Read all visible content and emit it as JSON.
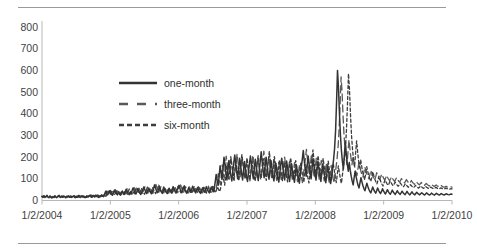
{
  "chart_data": {
    "type": "line",
    "title": "",
    "xlabel": "",
    "ylabel": "",
    "ylim": [
      0,
      800
    ],
    "yticks": [
      0,
      100,
      200,
      300,
      400,
      500,
      600,
      700,
      800
    ],
    "xticks": [
      "1/2/2004",
      "1/2/2005",
      "1/2/2006",
      "1/2/2007",
      "1/2/2008",
      "1/2/2009",
      "1/2/2010"
    ],
    "xlim": [
      "1/2/2004",
      "1/2/2010"
    ],
    "grid": false,
    "legend_position": "upper-center",
    "legend": [
      "one-month",
      "three-month",
      "six-month"
    ],
    "colors": {
      "one-month": "#333333",
      "three-month": "#5a5a5a",
      "six-month": "#3d3d3d",
      "axis": "#b7b7b7",
      "text": "#3f3f3f",
      "border": "#9a9a9a"
    },
    "series": [
      {
        "name": "one-month",
        "style": "solid",
        "values": [
          18,
          15,
          20,
          14,
          17,
          22,
          16,
          13,
          19,
          15,
          12,
          17,
          14,
          20,
          16,
          13,
          18,
          22,
          17,
          14,
          19,
          15,
          21,
          17,
          13,
          18,
          16,
          20,
          15,
          19,
          14,
          17,
          21,
          16,
          13,
          18,
          15,
          22,
          17,
          14,
          20,
          16,
          19,
          15,
          13,
          18,
          21,
          16,
          19,
          24,
          17,
          15,
          22,
          19,
          16,
          25,
          20,
          17,
          14,
          21,
          18,
          26,
          22,
          18,
          30,
          42,
          35,
          26,
          33,
          45,
          38,
          29,
          24,
          36,
          48,
          40,
          31,
          26,
          38,
          30,
          25,
          34,
          44,
          36,
          28,
          40,
          52,
          43,
          33,
          27,
          38,
          30,
          45,
          58,
          47,
          36,
          30,
          42,
          55,
          44,
          34,
          28,
          40,
          50,
          62,
          51,
          40,
          32,
          46,
          58,
          48,
          38,
          31,
          44,
          56,
          72,
          58,
          45,
          36,
          50,
          62,
          50,
          40,
          33,
          46,
          58,
          48,
          38,
          32,
          44,
          56,
          45,
          36,
          50,
          64,
          52,
          42,
          34,
          48,
          60,
          70,
          56,
          44,
          36,
          50,
          62,
          50,
          40,
          33,
          46,
          58,
          46,
          38,
          52,
          66,
          54,
          43,
          35,
          48,
          60,
          48,
          39,
          33,
          46,
          58,
          47,
          38,
          50,
          64,
          52,
          42,
          35,
          48,
          62,
          50,
          40,
          55,
          85,
          120,
          95,
          70,
          110,
          160,
          130,
          100,
          145,
          200,
          165,
          125,
          95,
          140,
          185,
          150,
          115,
          90,
          135,
          175,
          210,
          170,
          130,
          100,
          150,
          195,
          160,
          125,
          95,
          140,
          180,
          145,
          110,
          88,
          130,
          170,
          205,
          165,
          128,
          100,
          148,
          190,
          155,
          120,
          92,
          136,
          178,
          225,
          180,
          138,
          105,
          155,
          200,
          162,
          125,
          98,
          142,
          185,
          150,
          115,
          90,
          132,
          172,
          140,
          108,
          85,
          125,
          165,
          195,
          158,
          122,
          95,
          140,
          182,
          148,
          114,
          88,
          130,
          170,
          138,
          106,
          84,
          124,
          162,
          132,
          102,
          80,
          118,
          155,
          190,
          230,
          185,
          145,
          112,
          160,
          205,
          168,
          130,
          100,
          148,
          192,
          156,
          120,
          94,
          138,
          180,
          146,
          112,
          88,
          128,
          168,
          136,
          105,
          82,
          120,
          158,
          128,
          99,
          78,
          115,
          152,
          190,
          240,
          320,
          450,
          600,
          520,
          400,
          300,
          230,
          180,
          145,
          210,
          270,
          215,
          170,
          135,
          175,
          140,
          112,
          90,
          72,
          105,
          135,
          110,
          88,
          70,
          58,
          82,
          105,
          85,
          68,
          55,
          45,
          62,
          80,
          65,
          52,
          42,
          35,
          48,
          62,
          50,
          41,
          34,
          45,
          58,
          47,
          38,
          32,
          42,
          54,
          44,
          36,
          30,
          40,
          50,
          41,
          34,
          29,
          38,
          48,
          39,
          33,
          28,
          36,
          45,
          38,
          32,
          28,
          35,
          43,
          36,
          31,
          27,
          34,
          42,
          35,
          30,
          26,
          33,
          40,
          34,
          29,
          26,
          32,
          38,
          33,
          29,
          26,
          31,
          36,
          32,
          28,
          25,
          30,
          35,
          31,
          28,
          25,
          29,
          34,
          30,
          27,
          25,
          29,
          33,
          30,
          27,
          25,
          28,
          32,
          29,
          27,
          25,
          28,
          31,
          29,
          27,
          26,
          28,
          30,
          29
        ]
      },
      {
        "name": "three-month",
        "style": "long-dash",
        "values": [
          20,
          17,
          22,
          16,
          19,
          24,
          18,
          15,
          21,
          17,
          14,
          19,
          16,
          22,
          18,
          15,
          20,
          24,
          19,
          16,
          21,
          17,
          23,
          19,
          15,
          20,
          18,
          22,
          17,
          21,
          16,
          19,
          23,
          18,
          15,
          20,
          17,
          24,
          19,
          16,
          22,
          18,
          21,
          17,
          15,
          20,
          23,
          18,
          21,
          26,
          19,
          17,
          24,
          21,
          18,
          27,
          22,
          19,
          16,
          23,
          20,
          28,
          24,
          20,
          32,
          44,
          37,
          28,
          35,
          47,
          40,
          31,
          26,
          38,
          50,
          42,
          33,
          28,
          40,
          32,
          27,
          36,
          46,
          38,
          30,
          42,
          54,
          45,
          35,
          29,
          40,
          32,
          47,
          60,
          49,
          38,
          32,
          44,
          57,
          46,
          36,
          30,
          42,
          52,
          64,
          53,
          42,
          34,
          48,
          60,
          50,
          40,
          33,
          46,
          58,
          74,
          60,
          47,
          38,
          52,
          64,
          52,
          42,
          35,
          48,
          60,
          50,
          40,
          34,
          46,
          58,
          47,
          38,
          52,
          66,
          54,
          44,
          36,
          50,
          62,
          72,
          58,
          46,
          38,
          52,
          64,
          52,
          42,
          35,
          48,
          60,
          48,
          40,
          54,
          68,
          56,
          45,
          37,
          50,
          62,
          50,
          41,
          35,
          48,
          60,
          49,
          40,
          52,
          66,
          54,
          44,
          37,
          50,
          64,
          52,
          42,
          57,
          88,
          124,
          98,
          73,
          113,
          164,
          134,
          103,
          149,
          205,
          169,
          129,
          98,
          144,
          190,
          154,
          119,
          93,
          139,
          180,
          215,
          175,
          134,
          104,
          154,
          200,
          164,
          129,
          98,
          144,
          185,
          149,
          114,
          91,
          134,
          175,
          210,
          170,
          132,
          103,
          152,
          195,
          159,
          124,
          95,
          140,
          182,
          228,
          184,
          142,
          108,
          159,
          205,
          166,
          129,
          101,
          146,
          190,
          154,
          119,
          93,
          136,
          176,
          144,
          111,
          88,
          129,
          170,
          200,
          162,
          126,
          98,
          144,
          187,
          152,
          118,
          91,
          134,
          175,
          142,
          110,
          87,
          128,
          167,
          136,
          106,
          83,
          122,
          160,
          195,
          236,
          190,
          149,
          116,
          165,
          210,
          172,
          134,
          104,
          152,
          197,
          160,
          124,
          97,
          142,
          185,
          150,
          116,
          91,
          132,
          172,
          140,
          108,
          85,
          124,
          162,
          132,
          102,
          81,
          119,
          157,
          196,
          248,
          330,
          440,
          570,
          500,
          390,
          300,
          240,
          195,
          165,
          225,
          280,
          235,
          195,
          165,
          200,
          175,
          150,
          130,
          115,
          145,
          175,
          155,
          135,
          120,
          108,
          130,
          155,
          138,
          122,
          110,
          100,
          118,
          140,
          125,
          112,
          102,
          94,
          110,
          128,
          116,
          105,
          97,
          108,
          122,
          112,
          102,
          95,
          104,
          116,
          106,
          98,
          91,
          100,
          110,
          101,
          94,
          88,
          96,
          106,
          97,
          90,
          85,
          92,
          101,
          93,
          86,
          81,
          88,
          96,
          89,
          83,
          78,
          84,
          92,
          85,
          79,
          75,
          80,
          87,
          81,
          76,
          72,
          77,
          83,
          77,
          73,
          69,
          74,
          79,
          74,
          70,
          67,
          71,
          76,
          71,
          68,
          65,
          68,
          72,
          68,
          65,
          62,
          65,
          69,
          66,
          63,
          61,
          63,
          66,
          63,
          61,
          59,
          61,
          63,
          61
        ]
      },
      {
        "name": "six-month",
        "style": "short-dash",
        "values": [
          19,
          16,
          21,
          15,
          18,
          23,
          17,
          14,
          20,
          16,
          13,
          18,
          15,
          21,
          17,
          14,
          19,
          23,
          18,
          15,
          20,
          16,
          22,
          18,
          14,
          19,
          17,
          21,
          16,
          20,
          15,
          18,
          22,
          17,
          14,
          19,
          16,
          23,
          18,
          15,
          21,
          17,
          20,
          16,
          14,
          19,
          22,
          17,
          20,
          25,
          18,
          16,
          23,
          20,
          17,
          26,
          21,
          18,
          15,
          22,
          19,
          27,
          23,
          19,
          31,
          43,
          36,
          27,
          34,
          46,
          39,
          30,
          25,
          37,
          49,
          41,
          32,
          27,
          39,
          31,
          26,
          35,
          45,
          37,
          29,
          41,
          53,
          44,
          34,
          28,
          39,
          31,
          46,
          59,
          48,
          37,
          31,
          43,
          56,
          45,
          35,
          29,
          41,
          51,
          63,
          52,
          41,
          33,
          47,
          59,
          49,
          39,
          32,
          45,
          57,
          73,
          59,
          46,
          37,
          51,
          63,
          51,
          41,
          34,
          47,
          59,
          49,
          39,
          33,
          45,
          57,
          46,
          37,
          51,
          65,
          53,
          43,
          35,
          49,
          61,
          71,
          57,
          45,
          37,
          51,
          63,
          51,
          41,
          34,
          47,
          59,
          47,
          39,
          53,
          67,
          55,
          44,
          36,
          49,
          61,
          49,
          40,
          34,
          47,
          59,
          48,
          39,
          51,
          65,
          53,
          43,
          36,
          49,
          63,
          51,
          41,
          56,
          86,
          122,
          96,
          71,
          111,
          162,
          132,
          101,
          147,
          202,
          167,
          127,
          96,
          142,
          187,
          152,
          117,
          91,
          137,
          177,
          212,
          172,
          132,
          102,
          152,
          197,
          162,
          127,
          96,
          142,
          182,
          147,
          112,
          89,
          132,
          172,
          207,
          167,
          130,
          101,
          150,
          192,
          157,
          122,
          93,
          138,
          180,
          226,
          182,
          140,
          106,
          157,
          202,
          164,
          127,
          99,
          144,
          187,
          152,
          117,
          91,
          134,
          174,
          142,
          109,
          86,
          127,
          167,
          197,
          160,
          124,
          96,
          142,
          184,
          150,
          116,
          89,
          132,
          172,
          140,
          108,
          85,
          126,
          164,
          134,
          104,
          81,
          120,
          157,
          192,
          233,
          187,
          147,
          114,
          162,
          207,
          170,
          132,
          102,
          150,
          194,
          158,
          122,
          95,
          140,
          182,
          148,
          114,
          89,
          130,
          170,
          138,
          106,
          83,
          122,
          160,
          130,
          100,
          79,
          117,
          154,
          193,
          244,
          325,
          445,
          585,
          510,
          395,
          300,
          235,
          188,
          155,
          218,
          275,
          225,
          182,
          150,
          188,
          158,
          132,
          112,
          95,
          126,
          156,
          134,
          114,
          100,
          88,
          108,
          132,
          114,
          98,
          86,
          76,
          92,
          112,
          98,
          85,
          75,
          67,
          81,
          96,
          86,
          77,
          70,
          78,
          90,
          82,
          74,
          68,
          75,
          85,
          78,
          71,
          66,
          72,
          81,
          74,
          68,
          63,
          69,
          77,
          71,
          66,
          61,
          66,
          73,
          68,
          63,
          59,
          64,
          70,
          65,
          61,
          57,
          61,
          67,
          63,
          59,
          56,
          60,
          65,
          61,
          58,
          55,
          58,
          62,
          59,
          56,
          54,
          57,
          61,
          58,
          55,
          53,
          55,
          58,
          56,
          54,
          52,
          54,
          57,
          55,
          53,
          52,
          53,
          55,
          54
        ]
      }
    ]
  }
}
